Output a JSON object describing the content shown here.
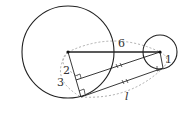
{
  "diagram": {
    "large_circle": {
      "center": [
        68,
        52
      ],
      "radius": 46
    },
    "small_circle": {
      "center": [
        160,
        52
      ],
      "radius": 17
    },
    "labels": {
      "center_distance": "6",
      "large_radius": "3",
      "radius_difference": "2",
      "small_radius": "1",
      "tangent_length": "l"
    },
    "colors": {
      "stroke": "#222222",
      "dashed": "#999999",
      "text": "#333333"
    }
  }
}
